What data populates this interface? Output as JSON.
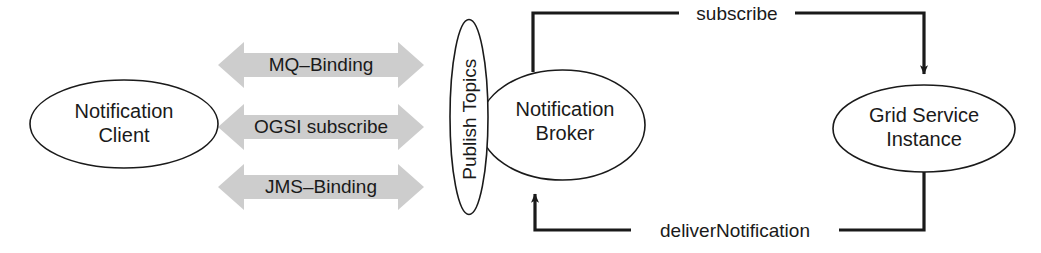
{
  "diagram": {
    "colors": {
      "stroke": "#1a1a1a",
      "node_fill": "#ffffff",
      "band_fill": "#cdcdcd",
      "background": "#ffffff",
      "text": "#1a1a1a"
    },
    "nodes": [
      {
        "id": "notification-client",
        "label": "Notification\nClient",
        "shape": "ellipse"
      },
      {
        "id": "publish-topics",
        "label": "Publish Topics",
        "shape": "ellipse-vertical",
        "text_orientation": "rotated-90"
      },
      {
        "id": "notification-broker",
        "label": "Notification\nBroker",
        "shape": "ellipse"
      },
      {
        "id": "grid-service-instance",
        "label": "Grid Service\nInstance",
        "shape": "ellipse"
      }
    ],
    "bindings": [
      {
        "id": "mq-binding",
        "label": "MQ–Binding",
        "shape": "double-headed-arrow"
      },
      {
        "id": "ogsi-subscribe",
        "label": "OGSI subscribe",
        "shape": "double-headed-arrow"
      },
      {
        "id": "jms-binding",
        "label": "JMS–Binding",
        "shape": "double-headed-arrow"
      }
    ],
    "edges": [
      {
        "id": "subscribe",
        "label": "subscribe",
        "from": "notification-broker",
        "to": "grid-service-instance",
        "arrowhead": "to"
      },
      {
        "id": "deliver-notification",
        "label": "deliverNotification",
        "from": "grid-service-instance",
        "to": "notification-broker",
        "arrowhead": "to"
      }
    ]
  }
}
